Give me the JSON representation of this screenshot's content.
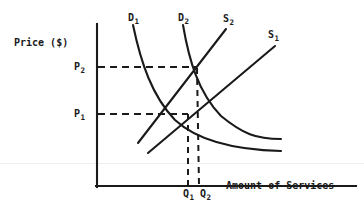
{
  "figure": {
    "axis_y_label": "Price ($)",
    "axis_x_label": "Amount of Services",
    "ink_color": "#1a1a1a",
    "background_color": "#ffffff"
  },
  "price_labels": [
    {
      "text": "P",
      "sub": "2"
    },
    {
      "text": "P",
      "sub": "1"
    }
  ],
  "quantity_labels": [
    {
      "text": "Q",
      "sub": "1"
    },
    {
      "text": "Q",
      "sub": "2"
    }
  ],
  "curve_labels": [
    {
      "text": "D",
      "sub": "1"
    },
    {
      "text": "D",
      "sub": "2"
    },
    {
      "text": "S",
      "sub": "2"
    },
    {
      "text": "S",
      "sub": "1"
    }
  ],
  "chart_data": {
    "type": "line",
    "title": "",
    "xlabel": "Amount of Services",
    "ylabel": "Price ($)",
    "grid": false,
    "legend": "inline-curve-labels",
    "axis_ranges": {
      "x": [
        0,
        1
      ],
      "y": [
        0,
        1
      ]
    },
    "annotations": [
      {
        "label": "P2",
        "kind": "price-level",
        "y_px": 67
      },
      {
        "label": "P1",
        "kind": "price-level",
        "y_px": 114
      },
      {
        "label": "Q1",
        "kind": "quantity-level",
        "x_px": 188
      },
      {
        "label": "Q2",
        "kind": "quantity-level",
        "x_px": 199
      }
    ],
    "equilibria": [
      {
        "name": "E1",
        "price": "P1",
        "quantity": "Q1",
        "x_px": 188,
        "y_px": 114,
        "curves": [
          "D1",
          "S1"
        ]
      },
      {
        "name": "E2",
        "price": "P2",
        "quantity": "Q2",
        "x_px": 196,
        "y_px": 67,
        "curves": [
          "D2",
          "S2"
        ]
      }
    ],
    "series": [
      {
        "name": "D1",
        "kind": "demand",
        "slope": "downward",
        "path": "M 133 25 C 141 63, 152 96, 175 120 C 200 143, 240 150, 281 151"
      },
      {
        "name": "D2",
        "kind": "demand",
        "slope": "downward",
        "path": "M 183 25 C 189 60, 198 92, 221 116 C 243 134, 256 139, 281 139"
      },
      {
        "name": "S2",
        "kind": "supply",
        "slope": "upward",
        "path": "M 138 143 L 226 29"
      },
      {
        "name": "S1",
        "kind": "supply",
        "slope": "upward",
        "path": "M 148 153 L 275 46"
      }
    ]
  }
}
